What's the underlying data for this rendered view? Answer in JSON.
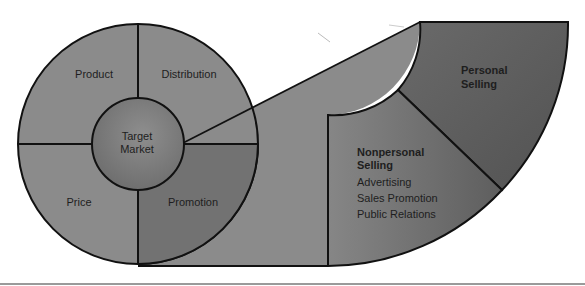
{
  "diagram": {
    "center": {
      "line1": "Target",
      "line2": "Market"
    },
    "quadrants": {
      "top_left": "Product",
      "top_right": "Distribution",
      "bottom_left": "Price",
      "bottom_right": "Promotion"
    },
    "promotion_fan": {
      "personal": {
        "line1": "Personal",
        "line2": "Selling"
      },
      "nonpersonal": {
        "line1": "Nonpersonal",
        "line2": "Selling",
        "items": [
          "Advertising",
          "Sales Promotion",
          "Public Relations"
        ]
      }
    },
    "colors": {
      "segment": "#8b8b8b",
      "promotion": "#727272",
      "center": "#7c7c7c",
      "personal": "#5c5c5c",
      "nonpersonal": "#747474",
      "stroke": "#111111"
    }
  }
}
